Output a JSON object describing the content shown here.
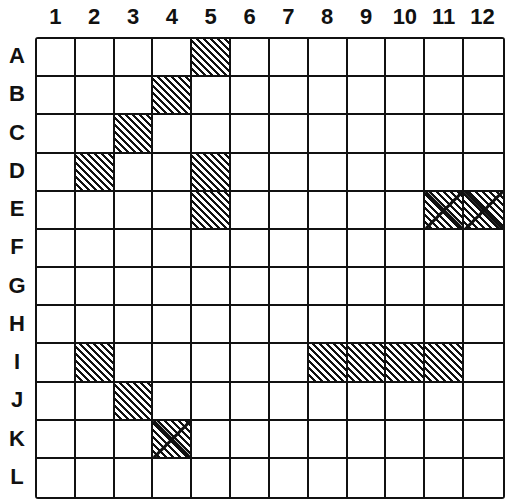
{
  "board": {
    "columns": [
      "1",
      "2",
      "3",
      "4",
      "5",
      "6",
      "7",
      "8",
      "9",
      "10",
      "11",
      "12"
    ],
    "rows": [
      "A",
      "B",
      "C",
      "D",
      "E",
      "F",
      "G",
      "H",
      "I",
      "J",
      "K",
      "L"
    ],
    "ship_cells": [
      "A5",
      "B4",
      "C3",
      "D2",
      "D5",
      "E5",
      "E11",
      "E12",
      "I2",
      "I8",
      "I9",
      "I10",
      "I11",
      "J3",
      "K4"
    ],
    "hit_cells": [
      "E11",
      "E12",
      "K4"
    ],
    "colors": {
      "line": "#111111",
      "background": "#ffffff"
    }
  }
}
